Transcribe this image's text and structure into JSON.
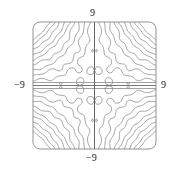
{
  "chart_data": {
    "type": "contour",
    "title": "",
    "xlabel": "",
    "ylabel": "",
    "xlim": [
      -9,
      9
    ],
    "ylim": [
      -9,
      9
    ],
    "tick_labels": {
      "top": "9",
      "bottom": "-9",
      "left": "-9",
      "right": "9"
    },
    "grid": false,
    "legend": null,
    "frame": {
      "rounded_corners": true
    },
    "line_color": "#8a8a8a",
    "axis_line_color": "#555555"
  }
}
